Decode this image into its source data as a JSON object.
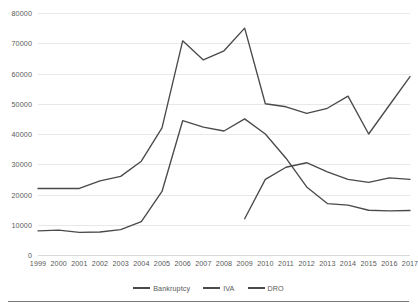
{
  "chart_data": {
    "type": "line",
    "title": "",
    "subtitle": "",
    "xlabel": "",
    "ylabel": "",
    "x": [
      1999,
      2000,
      2001,
      2002,
      2003,
      2004,
      2005,
      2006,
      2007,
      2008,
      2009,
      2010,
      2011,
      2012,
      2013,
      2014,
      2015,
      2016,
      2017
    ],
    "categories": [
      "1999",
      "2000",
      "2001",
      "2002",
      "2003",
      "2004",
      "2005",
      "2006",
      "2007",
      "2008",
      "2009",
      "2010",
      "2011",
      "2012",
      "2013",
      "2014",
      "2015",
      "2016",
      "2017"
    ],
    "series": [
      {
        "name": "Bankruptcy",
        "color": "#4a4a4a",
        "values": [
          8000,
          8200,
          7500,
          7600,
          8400,
          11000,
          21000,
          44400,
          42300,
          41000,
          45000,
          40000,
          32000,
          22500,
          17000,
          16500,
          14800,
          14600,
          14700
        ]
      },
      {
        "name": "IVA",
        "color": "#4a4a4a",
        "values": [
          22000,
          22000,
          22000,
          24500,
          26000,
          31000,
          42000,
          70800,
          64500,
          67500,
          75000,
          50000,
          49000,
          46800,
          48500,
          52500,
          40000,
          49500,
          59000
        ]
      },
      {
        "name": "DRO",
        "color": "#4a4a4a",
        "values": [
          null,
          null,
          null,
          null,
          null,
          null,
          null,
          null,
          null,
          null,
          12000,
          25000,
          29000,
          30500,
          27500,
          25000,
          24000,
          25500,
          25000
        ]
      }
    ],
    "ylim": [
      0,
      80000
    ],
    "y_ticks": [
      0,
      10000,
      20000,
      30000,
      40000,
      50000,
      60000,
      70000,
      80000
    ],
    "y_tick_labels": [
      "0",
      "10000",
      "20000",
      "30000",
      "40000",
      "50000",
      "60000",
      "70000",
      "80000"
    ],
    "grid": true,
    "grid_axis": "y",
    "legend": {
      "position": "bottom",
      "entries": [
        "Bankruptcy",
        "IVA",
        "DRO"
      ]
    },
    "markers": false
  }
}
